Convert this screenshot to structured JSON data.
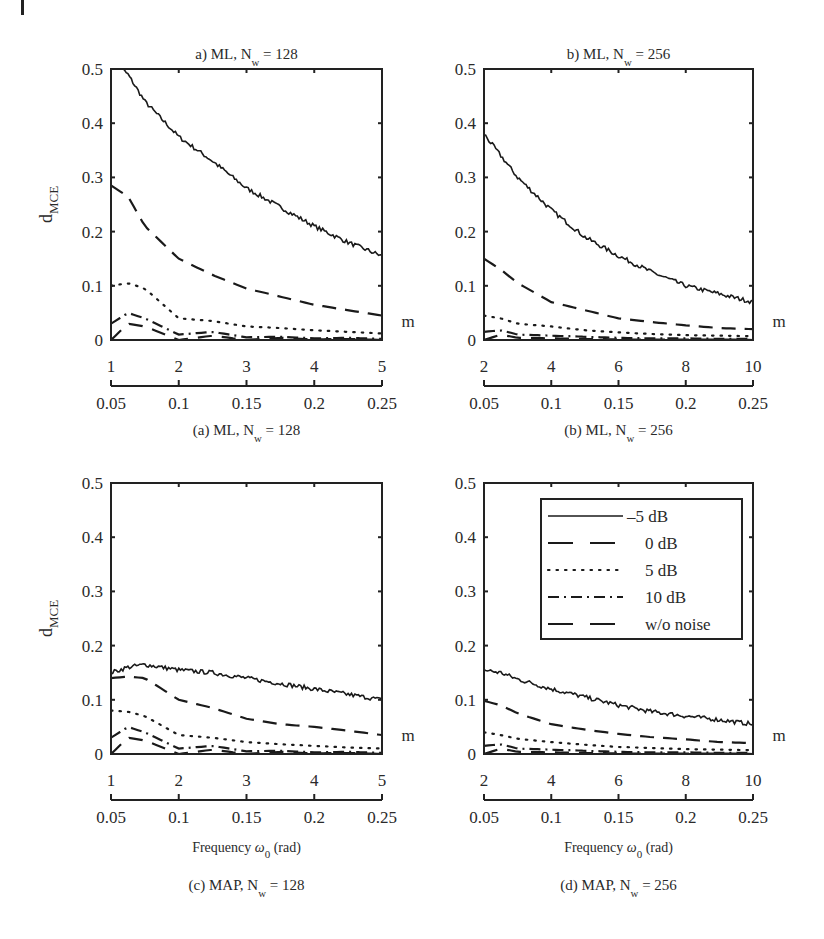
{
  "figure": {
    "ylabel": "d",
    "ylabel_sub": "MCE",
    "secondary_axis_label": "m",
    "xlabel": "Frequency ω",
    "xlabel_sub": "0",
    "xlabel_unit": "(rad)"
  },
  "legend": {
    "entries": [
      {
        "label": "–5 dB",
        "style": "solid"
      },
      {
        "label": "0 dB",
        "style": "dashed"
      },
      {
        "label": "5 dB",
        "style": "dotted"
      },
      {
        "label": "10 dB",
        "style": "dashdot"
      },
      {
        "label": "w/o noise",
        "style": "longdash"
      }
    ]
  },
  "colors": {
    "line": "#1a1a1a",
    "axis": "#222222",
    "background": "#ffffff"
  },
  "chart_data": [
    {
      "type": "line",
      "panel": "a",
      "title": "a) ML,  N_w = 128",
      "caption": "(a) ML,  N_w = 128",
      "xlabel": "",
      "ylabel": "d_MCE",
      "ylim": [
        0,
        0.5
      ],
      "yticks": [
        "0",
        "0.1",
        "0.2",
        "0.3",
        "0.4",
        "0.5"
      ],
      "m_ticks": [
        "1",
        "2",
        "3",
        "4",
        "5"
      ],
      "freq_ticks": [
        "0.05",
        "0.1",
        "0.15",
        "0.2",
        "0.25"
      ],
      "x": [
        1.0,
        1.25,
        1.5,
        2.0,
        2.5,
        3.0,
        3.5,
        4.0,
        4.5,
        5.0
      ],
      "series": [
        {
          "name": "-5 dB",
          "values": [
            0.52,
            0.49,
            0.44,
            0.375,
            0.33,
            0.28,
            0.245,
            0.21,
            0.18,
            0.155
          ]
        },
        {
          "name": "0 dB",
          "values": [
            0.285,
            0.265,
            0.21,
            0.15,
            0.12,
            0.095,
            0.08,
            0.065,
            0.055,
            0.045
          ]
        },
        {
          "name": "5 dB",
          "values": [
            0.1,
            0.105,
            0.095,
            0.04,
            0.035,
            0.025,
            0.022,
            0.018,
            0.015,
            0.012
          ]
        },
        {
          "name": "10 dB",
          "values": [
            0.03,
            0.05,
            0.04,
            0.01,
            0.015,
            0.005,
            0.006,
            0.003,
            0.004,
            0.002
          ]
        },
        {
          "name": "w/o noise",
          "values": [
            0.0,
            0.03,
            0.025,
            0.0,
            0.008,
            0.0,
            0.004,
            0.001,
            0.002,
            0.0
          ]
        }
      ]
    },
    {
      "type": "line",
      "panel": "b",
      "title": "b) ML,  N_w = 256",
      "caption": "(b) ML,  N_w = 256",
      "xlabel": "",
      "ylabel": "",
      "ylim": [
        0,
        0.5
      ],
      "yticks": [
        "0",
        "0.1",
        "0.2",
        "0.3",
        "0.4",
        "0.5"
      ],
      "m_ticks": [
        "2",
        "4",
        "6",
        "8",
        "10"
      ],
      "freq_ticks": [
        "0.05",
        "0.1",
        "0.15",
        "0.2",
        "0.25"
      ],
      "x": [
        2,
        2.5,
        3,
        4,
        5,
        6,
        7,
        8,
        9,
        10
      ],
      "series": [
        {
          "name": "-5 dB",
          "values": [
            0.38,
            0.34,
            0.3,
            0.24,
            0.19,
            0.155,
            0.125,
            0.1,
            0.085,
            0.07
          ]
        },
        {
          "name": "0 dB",
          "values": [
            0.15,
            0.13,
            0.105,
            0.07,
            0.055,
            0.04,
            0.033,
            0.027,
            0.022,
            0.02
          ]
        },
        {
          "name": "5 dB",
          "values": [
            0.045,
            0.04,
            0.03,
            0.025,
            0.018,
            0.014,
            0.011,
            0.009,
            0.008,
            0.007
          ]
        },
        {
          "name": "10 dB",
          "values": [
            0.015,
            0.018,
            0.01,
            0.008,
            0.006,
            0.004,
            0.003,
            0.003,
            0.002,
            0.002
          ]
        },
        {
          "name": "w/o noise",
          "values": [
            0.0,
            0.01,
            0.004,
            0.003,
            0.002,
            0.001,
            0.001,
            0.001,
            0.001,
            0.0
          ]
        }
      ]
    },
    {
      "type": "line",
      "panel": "c",
      "title": "",
      "caption": "(c) MAP,  N_w = 128",
      "xlabel": "Frequency ω_0 (rad)",
      "ylabel": "d_MCE",
      "ylim": [
        0,
        0.5
      ],
      "yticks": [
        "0",
        "0.1",
        "0.2",
        "0.3",
        "0.4",
        "0.5"
      ],
      "m_ticks": [
        "1",
        "2",
        "3",
        "4",
        "5"
      ],
      "freq_ticks": [
        "0.05",
        "0.1",
        "0.15",
        "0.2",
        "0.25"
      ],
      "x": [
        1.0,
        1.25,
        1.5,
        2.0,
        2.5,
        3.0,
        3.5,
        4.0,
        4.5,
        5.0
      ],
      "series": [
        {
          "name": "-5 dB",
          "values": [
            0.15,
            0.16,
            0.165,
            0.155,
            0.15,
            0.14,
            0.13,
            0.12,
            0.11,
            0.1
          ]
        },
        {
          "name": "0 dB",
          "values": [
            0.14,
            0.143,
            0.14,
            0.1,
            0.085,
            0.065,
            0.055,
            0.05,
            0.043,
            0.035
          ]
        },
        {
          "name": "5 dB",
          "values": [
            0.08,
            0.078,
            0.07,
            0.035,
            0.03,
            0.022,
            0.018,
            0.015,
            0.012,
            0.01
          ]
        },
        {
          "name": "10 dB",
          "values": [
            0.03,
            0.05,
            0.04,
            0.01,
            0.015,
            0.005,
            0.006,
            0.003,
            0.004,
            0.002
          ]
        },
        {
          "name": "w/o noise",
          "values": [
            0.0,
            0.03,
            0.025,
            0.0,
            0.008,
            0.0,
            0.004,
            0.001,
            0.002,
            0.0
          ]
        }
      ]
    },
    {
      "type": "line",
      "panel": "d",
      "title": "",
      "caption": "(d) MAP,  N_w = 256",
      "xlabel": "Frequency ω_0 (rad)",
      "ylabel": "",
      "ylim": [
        0,
        0.5
      ],
      "yticks": [
        "0",
        "0.1",
        "0.2",
        "0.3",
        "0.4",
        "0.5"
      ],
      "m_ticks": [
        "2",
        "4",
        "6",
        "8",
        "10"
      ],
      "freq_ticks": [
        "0.05",
        "0.1",
        "0.15",
        "0.2",
        "0.25"
      ],
      "x": [
        2,
        2.5,
        3,
        4,
        5,
        6,
        7,
        8,
        9,
        10
      ],
      "series": [
        {
          "name": "-5 dB",
          "values": [
            0.155,
            0.15,
            0.138,
            0.12,
            0.105,
            0.09,
            0.078,
            0.07,
            0.063,
            0.055
          ]
        },
        {
          "name": "0 dB",
          "values": [
            0.098,
            0.09,
            0.075,
            0.055,
            0.045,
            0.037,
            0.031,
            0.027,
            0.022,
            0.02
          ]
        },
        {
          "name": "5 dB",
          "values": [
            0.04,
            0.035,
            0.028,
            0.022,
            0.017,
            0.013,
            0.011,
            0.009,
            0.008,
            0.007
          ]
        },
        {
          "name": "10 dB",
          "values": [
            0.015,
            0.018,
            0.01,
            0.008,
            0.006,
            0.004,
            0.003,
            0.003,
            0.002,
            0.002
          ]
        },
        {
          "name": "w/o noise",
          "values": [
            0.0,
            0.01,
            0.004,
            0.003,
            0.002,
            0.001,
            0.001,
            0.001,
            0.001,
            0.0
          ]
        }
      ]
    }
  ]
}
